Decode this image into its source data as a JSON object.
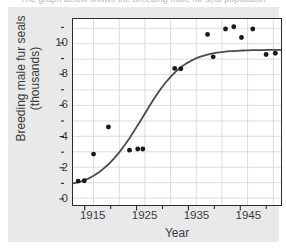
{
  "figure": {
    "caption_cut_off": "The graph below shows the breeding male fur seal population",
    "panel_color": "#e9e9e9",
    "plot_background": "#ffffff",
    "frame_color": "#2b2b2b",
    "gridline_color": "#d8d8dc",
    "point_color": "#1a1a1a",
    "curve_color": "#4a4a4a"
  },
  "chart_data": {
    "type": "scatter",
    "title": "",
    "xlabel": "Year",
    "ylabel": "Breeding male fur seals (thousands)",
    "ylabel_line1": "Breeding male fur seals",
    "ylabel_line2": "(thousands)",
    "xlim": [
      1911,
      1951.5
    ],
    "ylim": [
      -0.45,
      11.6
    ],
    "grid": true,
    "legend": "none",
    "x_major_ticks": [
      1915,
      1925,
      1935,
      1945
    ],
    "x_major_tick_labels": [
      "1915",
      "1925",
      "1935",
      "1945"
    ],
    "x_minor_ticks": [
      1920,
      1930,
      1940,
      1950
    ],
    "y_major_ticks": [
      0,
      2,
      4,
      6,
      8,
      10
    ],
    "y_major_tick_labels": [
      "0",
      "2",
      "4",
      "6",
      "8",
      "10"
    ],
    "y_minor_ticks": [
      1,
      3,
      5,
      7,
      9,
      11
    ],
    "points": [
      {
        "x": 1912.0,
        "y": 1.1
      },
      {
        "x": 1913.2,
        "y": 1.12
      },
      {
        "x": 1915.0,
        "y": 2.85
      },
      {
        "x": 1917.9,
        "y": 4.6
      },
      {
        "x": 1922.0,
        "y": 3.1
      },
      {
        "x": 1923.6,
        "y": 3.18
      },
      {
        "x": 1924.6,
        "y": 3.18
      },
      {
        "x": 1930.8,
        "y": 8.4
      },
      {
        "x": 1932.0,
        "y": 8.38
      },
      {
        "x": 1937.2,
        "y": 10.6
      },
      {
        "x": 1938.3,
        "y": 9.15
      },
      {
        "x": 1940.7,
        "y": 10.95
      },
      {
        "x": 1942.3,
        "y": 11.1
      },
      {
        "x": 1943.8,
        "y": 10.4
      },
      {
        "x": 1946.0,
        "y": 10.95
      },
      {
        "x": 1948.6,
        "y": 9.3
      },
      {
        "x": 1950.4,
        "y": 9.38
      }
    ],
    "fitted_curve": {
      "kind": "logistic",
      "asymptote": 9.6,
      "midpoint_year": 1927.5,
      "points": [
        {
          "x": 1911.0,
          "y": 0.95
        },
        {
          "x": 1912.0,
          "y": 1.02
        },
        {
          "x": 1913.0,
          "y": 1.12
        },
        {
          "x": 1914.0,
          "y": 1.26
        },
        {
          "x": 1915.0,
          "y": 1.44
        },
        {
          "x": 1916.0,
          "y": 1.66
        },
        {
          "x": 1917.0,
          "y": 1.92
        },
        {
          "x": 1918.0,
          "y": 2.22
        },
        {
          "x": 1919.0,
          "y": 2.57
        },
        {
          "x": 1920.0,
          "y": 2.96
        },
        {
          "x": 1921.0,
          "y": 3.4
        },
        {
          "x": 1922.0,
          "y": 3.88
        },
        {
          "x": 1923.0,
          "y": 4.4
        },
        {
          "x": 1924.0,
          "y": 4.93
        },
        {
          "x": 1925.0,
          "y": 5.48
        },
        {
          "x": 1926.0,
          "y": 6.03
        },
        {
          "x": 1927.0,
          "y": 6.55
        },
        {
          "x": 1928.0,
          "y": 7.03
        },
        {
          "x": 1929.0,
          "y": 7.47
        },
        {
          "x": 1930.0,
          "y": 7.85
        },
        {
          "x": 1931.0,
          "y": 8.19
        },
        {
          "x": 1932.0,
          "y": 8.47
        },
        {
          "x": 1933.0,
          "y": 8.71
        },
        {
          "x": 1934.0,
          "y": 8.9
        },
        {
          "x": 1935.0,
          "y": 9.06
        },
        {
          "x": 1936.0,
          "y": 9.18
        },
        {
          "x": 1937.0,
          "y": 9.28
        },
        {
          "x": 1938.0,
          "y": 9.36
        },
        {
          "x": 1939.0,
          "y": 9.42
        },
        {
          "x": 1940.0,
          "y": 9.46
        },
        {
          "x": 1941.0,
          "y": 9.5
        },
        {
          "x": 1942.0,
          "y": 9.52
        },
        {
          "x": 1943.0,
          "y": 9.54
        },
        {
          "x": 1944.0,
          "y": 9.56
        },
        {
          "x": 1945.0,
          "y": 9.57
        },
        {
          "x": 1946.0,
          "y": 9.58
        },
        {
          "x": 1947.0,
          "y": 9.59
        },
        {
          "x": 1948.0,
          "y": 9.59
        },
        {
          "x": 1949.0,
          "y": 9.6
        },
        {
          "x": 1950.0,
          "y": 9.6
        },
        {
          "x": 1951.5,
          "y": 9.6
        }
      ]
    }
  }
}
